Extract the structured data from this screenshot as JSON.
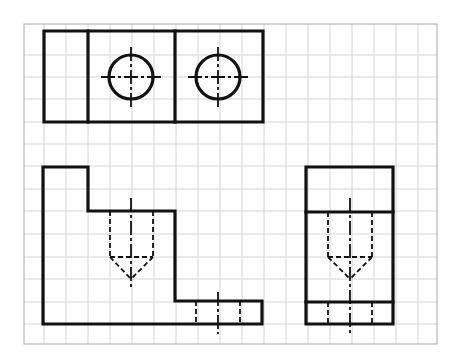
{
  "drawing": {
    "title": "Orthographic projection on grid paper",
    "colors": {
      "line": "#111111",
      "grid": "#d4d4d4",
      "grid_border": "#a8a8a8",
      "background": "#ffffff"
    },
    "grid": {
      "x0": 24,
      "y0": 24,
      "x1": 437,
      "y1": 344,
      "verticals": [
        44,
        66,
        88,
        110,
        132,
        154,
        176,
        198,
        220,
        242,
        264,
        286,
        308,
        330,
        352,
        374,
        396,
        418
      ],
      "horizontals": [
        55,
        77,
        99,
        122,
        144,
        166,
        189,
        211,
        234,
        257,
        279,
        302,
        324
      ]
    },
    "views": {
      "top_view": {
        "label": "Top view",
        "outline": [
          [
            44,
            31
          ],
          [
            263,
            31
          ],
          [
            263,
            122
          ],
          [
            44,
            122
          ]
        ],
        "dividers": [
          [
            [
              88,
              31
            ],
            [
              88,
              122
            ]
          ],
          [
            [
              175,
              31
            ],
            [
              175,
              122
            ]
          ]
        ],
        "holes": [
          {
            "cx": 131,
            "cy": 77,
            "r": 22
          },
          {
            "cx": 218,
            "cy": 77,
            "r": 22
          }
        ]
      },
      "front_view": {
        "label": "Front view",
        "outline": [
          [
            43,
            167
          ],
          [
            88,
            167
          ],
          [
            88,
            211
          ],
          [
            175,
            211
          ],
          [
            175,
            301
          ],
          [
            262,
            301
          ],
          [
            262,
            324
          ],
          [
            43,
            324
          ]
        ],
        "hidden": [
          [
            [
              110,
              211
            ],
            [
              110,
              257
            ]
          ],
          [
            [
              153,
              211
            ],
            [
              153,
              257
            ]
          ],
          [
            [
              110,
              257
            ],
            [
              153,
              257
            ]
          ],
          [
            [
              110,
              257
            ],
            [
              131,
              279
            ]
          ],
          [
            [
              153,
              257
            ],
            [
              131,
              279
            ]
          ],
          [
            [
              196,
              301
            ],
            [
              196,
              324
            ]
          ],
          [
            [
              240,
              301
            ],
            [
              240,
              324
            ]
          ]
        ],
        "centerlines": [
          [
            [
              131,
              198
            ],
            [
              131,
              290
            ]
          ],
          [
            [
              218,
              292
            ],
            [
              218,
              334
            ]
          ]
        ]
      },
      "side_view": {
        "label": "Side view",
        "outline": [
          [
            306,
            167
          ],
          [
            393,
            167
          ],
          [
            393,
            324
          ],
          [
            306,
            324
          ]
        ],
        "edges": [
          [
            [
              306,
              212
            ],
            [
              393,
              212
            ]
          ],
          [
            [
              306,
              302
            ],
            [
              393,
              302
            ]
          ]
        ],
        "hidden": [
          [
            [
              328,
              212
            ],
            [
              328,
              257
            ]
          ],
          [
            [
              372,
              212
            ],
            [
              372,
              257
            ]
          ],
          [
            [
              328,
              257
            ],
            [
              372,
              257
            ]
          ],
          [
            [
              328,
              257
            ],
            [
              350,
              279
            ]
          ],
          [
            [
              372,
              257
            ],
            [
              350,
              279
            ]
          ],
          [
            [
              328,
              302
            ],
            [
              328,
              324
            ]
          ],
          [
            [
              372,
              302
            ],
            [
              372,
              324
            ]
          ]
        ],
        "centerlines": [
          [
            [
              350,
              198
            ],
            [
              350,
              334
            ]
          ]
        ]
      }
    }
  }
}
